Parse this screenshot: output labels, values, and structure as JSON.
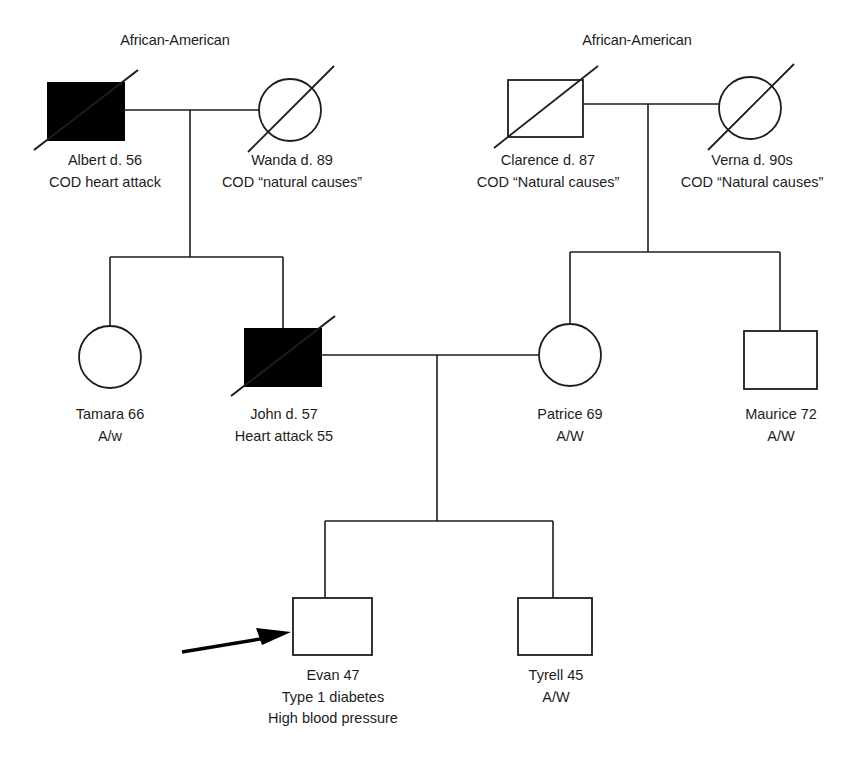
{
  "diagram": {
    "type": "pedigree-genogram",
    "legend": {
      "filled_shape_meaning": "affected individual",
      "slash_meaning": "deceased",
      "arrow_meaning": "proband"
    },
    "ethnicity_labels": [
      {
        "id": "ethnic-left",
        "text": "African-American",
        "x": 175,
        "y": 40
      },
      {
        "id": "ethnic-right",
        "text": "African-American",
        "x": 637,
        "y": 40
      }
    ],
    "generations": [
      {
        "id": "generation-1",
        "individuals": [
          {
            "id": "albert",
            "name_line": "Albert d. 56",
            "detail_lines": [
              "COD heart attack"
            ],
            "sex": "male",
            "shape": "square",
            "affected": true,
            "deceased": true,
            "x": 86,
            "y": 111,
            "size": 75
          },
          {
            "id": "wanda",
            "name_line": "Wanda d. 89",
            "detail_lines": [
              "COD “natural causes”"
            ],
            "sex": "female",
            "shape": "circle",
            "affected": false,
            "deceased": true,
            "x": 290,
            "y": 110,
            "size": 62
          },
          {
            "id": "clarence",
            "name_line": "Clarence d. 87",
            "detail_lines": [
              "COD “Natural causes”"
            ],
            "sex": "male",
            "shape": "square",
            "affected": false,
            "deceased": true,
            "x": 545,
            "y": 108,
            "size": 75
          },
          {
            "id": "verna",
            "name_line": "Verna d. 90s",
            "detail_lines": [
              "COD “Natural causes”"
            ],
            "sex": "female",
            "shape": "circle",
            "affected": false,
            "deceased": true,
            "x": 750,
            "y": 108,
            "size": 62
          }
        ]
      },
      {
        "id": "generation-2",
        "individuals": [
          {
            "id": "tamara",
            "name_line": "Tamara 66",
            "detail_lines": [
              "A/w"
            ],
            "sex": "female",
            "shape": "circle",
            "affected": false,
            "deceased": false,
            "x": 110,
            "y": 357,
            "size": 62
          },
          {
            "id": "john",
            "name_line": "John d. 57",
            "detail_lines": [
              "Heart attack 55"
            ],
            "sex": "male",
            "shape": "square",
            "affected": true,
            "deceased": true,
            "x": 283,
            "y": 357,
            "size": 76
          },
          {
            "id": "patrice",
            "name_line": "Patrice 69",
            "detail_lines": [
              "A/W"
            ],
            "sex": "female",
            "shape": "circle",
            "affected": false,
            "deceased": false,
            "x": 570,
            "y": 355,
            "size": 62
          },
          {
            "id": "maurice",
            "name_line": "Maurice 72",
            "detail_lines": [
              "A/W"
            ],
            "sex": "male",
            "shape": "square",
            "affected": false,
            "deceased": false,
            "x": 780,
            "y": 360,
            "size": 73
          }
        ]
      },
      {
        "id": "generation-3",
        "individuals": [
          {
            "id": "evan",
            "name_line": "Evan 47",
            "detail_lines": [
              "Type 1 diabetes",
              "High blood pressure"
            ],
            "sex": "male",
            "shape": "square",
            "affected": false,
            "deceased": false,
            "proband": true,
            "x": 332,
            "y": 626,
            "size": 78
          },
          {
            "id": "tyrell",
            "name_line": "Tyrell 45",
            "detail_lines": [
              "A/W"
            ],
            "sex": "male",
            "shape": "square",
            "affected": false,
            "deceased": false,
            "x": 555,
            "y": 626,
            "size": 74
          }
        ]
      }
    ],
    "unions": [
      {
        "id": "union-albert-wanda",
        "partners": [
          "albert",
          "wanda"
        ],
        "children": [
          "tamara",
          "john"
        ]
      },
      {
        "id": "union-clarence-verna",
        "partners": [
          "clarence",
          "verna"
        ],
        "children": [
          "patrice",
          "maurice"
        ]
      },
      {
        "id": "union-john-patrice",
        "partners": [
          "john",
          "patrice"
        ],
        "children": [
          "evan",
          "tyrell"
        ]
      }
    ],
    "colors": {
      "line": "#1d1d1d",
      "affected_fill": "#000000",
      "unaffected_fill": "#ffffff",
      "text": "#1d1d1d",
      "background": "#ffffff"
    }
  }
}
